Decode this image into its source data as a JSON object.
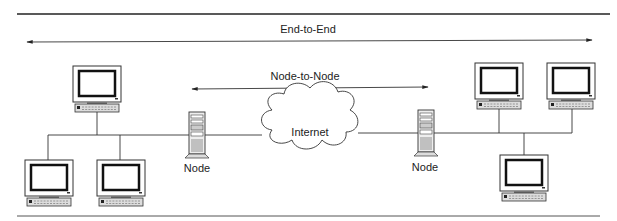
{
  "diagram": {
    "spans": [
      {
        "id": "end-to-end",
        "label": "End-to-End"
      },
      {
        "id": "node-to-node",
        "label": "Node-to-Node"
      }
    ],
    "cloud": {
      "label": "Internet"
    },
    "nodes": [
      {
        "id": "left-node",
        "label": "Node"
      },
      {
        "id": "right-node",
        "label": "Node"
      }
    ],
    "left_hosts": 3,
    "right_hosts": 3
  }
}
